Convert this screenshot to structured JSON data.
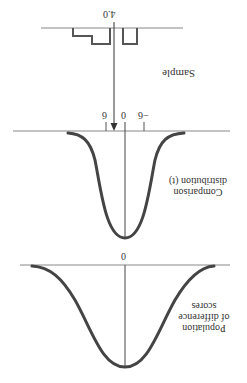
{
  "orientation": "rotated-180",
  "colors": {
    "axis": "#888888",
    "curve": "#444444",
    "line": "#333333",
    "text": "#333333"
  },
  "sample": {
    "label": "Sample",
    "mean_label": "4.0"
  },
  "comparison": {
    "label_line1": "Comparison",
    "label_line2": "distribution (t)",
    "ticks": [
      "6",
      "0",
      "−6"
    ]
  },
  "population": {
    "label_line1": "Population",
    "label_line2": "of difference",
    "label_line3": "scores",
    "center_tick": "0"
  }
}
